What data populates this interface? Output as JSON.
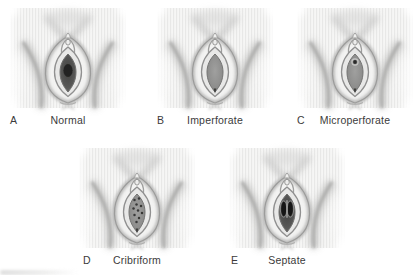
{
  "panels": [
    {
      "letter": "A",
      "label": "Normal",
      "variant": "normal-hymen-illustration"
    },
    {
      "letter": "B",
      "label": "Imperforate",
      "variant": "imperforate-hymen-illustration"
    },
    {
      "letter": "C",
      "label": "Microperforate",
      "variant": "microperforate-hymen-illustration"
    },
    {
      "letter": "D",
      "label": "Cribriform",
      "variant": "cribriform-hymen-illustration"
    },
    {
      "letter": "E",
      "label": "Septate",
      "variant": "septate-hymen-illustration"
    }
  ],
  "colors": {
    "background": "#ffffff",
    "skin_base": "#f6f6f5",
    "stripe": "#e8e8e7",
    "outline_gray": "#9c9c9b",
    "crease_gray": "#b3b3b2",
    "membrane_gray": "#8d8d8c",
    "vestibule_dark": "#4f4f4e",
    "opening_black": "#1c1c1b",
    "label_text": "#3b3b3b"
  }
}
